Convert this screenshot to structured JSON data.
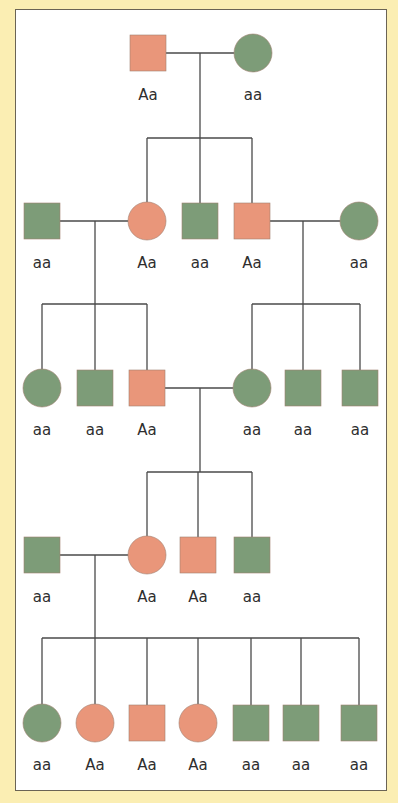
{
  "colors": {
    "background": "#fbeeb3",
    "panel": "#ffffff",
    "affected": "#e9967a",
    "unaffected": "#7d9c78",
    "line": "#4a4a4a"
  },
  "legend_note": "Orange = Aa, Green = aa",
  "generations": [
    {
      "id": "I",
      "individuals": [
        {
          "id": "I-1",
          "sex": "male",
          "genotype": "Aa",
          "x": 148,
          "y": 53
        },
        {
          "id": "I-2",
          "sex": "female",
          "genotype": "aa",
          "x": 253,
          "y": 53
        }
      ]
    },
    {
      "id": "II",
      "individuals": [
        {
          "id": "II-1",
          "sex": "male",
          "genotype": "aa",
          "x": 42,
          "y": 221
        },
        {
          "id": "II-2",
          "sex": "female",
          "genotype": "Aa",
          "x": 147,
          "y": 221
        },
        {
          "id": "II-3",
          "sex": "male",
          "genotype": "aa",
          "x": 200,
          "y": 221
        },
        {
          "id": "II-4",
          "sex": "male",
          "genotype": "Aa",
          "x": 252,
          "y": 221
        },
        {
          "id": "II-5",
          "sex": "female",
          "genotype": "aa",
          "x": 359,
          "y": 221
        }
      ]
    },
    {
      "id": "III",
      "individuals": [
        {
          "id": "III-1",
          "sex": "female",
          "genotype": "aa",
          "x": 42,
          "y": 388
        },
        {
          "id": "III-2",
          "sex": "male",
          "genotype": "aa",
          "x": 95,
          "y": 388
        },
        {
          "id": "III-3",
          "sex": "male",
          "genotype": "Aa",
          "x": 147,
          "y": 388
        },
        {
          "id": "III-4",
          "sex": "female",
          "genotype": "aa",
          "x": 252,
          "y": 388
        },
        {
          "id": "III-5",
          "sex": "male",
          "genotype": "aa",
          "x": 303,
          "y": 388
        },
        {
          "id": "III-6",
          "sex": "male",
          "genotype": "aa",
          "x": 360,
          "y": 388
        }
      ]
    },
    {
      "id": "IV",
      "individuals": [
        {
          "id": "IV-1",
          "sex": "male",
          "genotype": "aa",
          "x": 42,
          "y": 555
        },
        {
          "id": "IV-2",
          "sex": "female",
          "genotype": "Aa",
          "x": 147,
          "y": 555
        },
        {
          "id": "IV-3",
          "sex": "male",
          "genotype": "Aa",
          "x": 198,
          "y": 555
        },
        {
          "id": "IV-4",
          "sex": "male",
          "genotype": "aa",
          "x": 252,
          "y": 555
        }
      ]
    },
    {
      "id": "V",
      "individuals": [
        {
          "id": "V-1",
          "sex": "female",
          "genotype": "aa",
          "x": 42,
          "y": 723
        },
        {
          "id": "V-2",
          "sex": "female",
          "genotype": "Aa",
          "x": 95,
          "y": 723
        },
        {
          "id": "V-3",
          "sex": "male",
          "genotype": "Aa",
          "x": 147,
          "y": 723
        },
        {
          "id": "V-4",
          "sex": "female",
          "genotype": "Aa",
          "x": 198,
          "y": 723
        },
        {
          "id": "V-5",
          "sex": "male",
          "genotype": "aa",
          "x": 251,
          "y": 723
        },
        {
          "id": "V-6",
          "sex": "male",
          "genotype": "aa",
          "x": 301,
          "y": 723
        },
        {
          "id": "V-7",
          "sex": "male",
          "genotype": "aa",
          "x": 359,
          "y": 723
        }
      ]
    }
  ],
  "lines": [
    [
      166,
      53,
      234,
      53
    ],
    [
      200,
      53,
      200,
      138
    ],
    [
      147,
      138,
      252,
      138
    ],
    [
      147,
      138,
      147,
      202
    ],
    [
      200,
      138,
      200,
      203
    ],
    [
      252,
      138,
      252,
      203
    ],
    [
      60,
      221,
      128,
      221
    ],
    [
      95,
      221,
      95,
      304
    ],
    [
      42,
      304,
      147,
      304
    ],
    [
      42,
      304,
      42,
      369
    ],
    [
      95,
      304,
      95,
      370
    ],
    [
      147,
      304,
      147,
      370
    ],
    [
      270,
      221,
      340,
      221
    ],
    [
      303,
      221,
      303,
      304
    ],
    [
      252,
      304,
      360,
      304
    ],
    [
      252,
      304,
      252,
      369
    ],
    [
      303,
      304,
      303,
      370
    ],
    [
      360,
      304,
      360,
      370
    ],
    [
      165,
      388,
      233,
      388
    ],
    [
      200,
      388,
      200,
      472
    ],
    [
      147,
      472,
      252,
      472
    ],
    [
      147,
      472,
      147,
      536
    ],
    [
      198,
      472,
      198,
      537
    ],
    [
      252,
      472,
      252,
      537
    ],
    [
      60,
      555,
      128,
      555
    ],
    [
      95,
      555,
      95,
      638
    ],
    [
      42,
      638,
      359,
      638
    ],
    [
      42,
      638,
      42,
      704
    ],
    [
      95,
      638,
      95,
      704
    ],
    [
      147,
      638,
      147,
      705
    ],
    [
      198,
      638,
      198,
      704
    ],
    [
      251,
      638,
      251,
      705
    ],
    [
      301,
      638,
      301,
      705
    ],
    [
      359,
      638,
      359,
      705
    ]
  ]
}
